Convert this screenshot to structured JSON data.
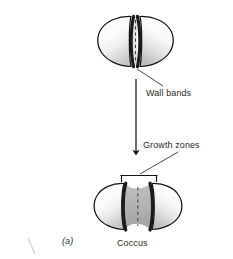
{
  "figure": {
    "panel_letter": "(a)",
    "caption": "Coccus",
    "labels": {
      "wall_bands": "Wall bands",
      "growth_zones": "Growth zones"
    },
    "colors": {
      "outline": "#1a1a1a",
      "band": "#202020",
      "cell_light": "#fbfbfb",
      "cell_shade": "#c9c9c9",
      "growth_zone_fill": "#b2b2b2",
      "septum_dash": "#4a4a4a",
      "text": "#2b2b2b",
      "background": "#ffffff"
    },
    "elements": {
      "top_cell_name": "coccus-before-division",
      "bottom_cell_name": "coccus-during-division",
      "arrow_name": "process-arrow-down",
      "bracket_name": "growth-zones-bracket",
      "wall_bands_leader": "wall-bands-leader-line",
      "growth_zones_leader": "growth-zones-leader-line",
      "scan_artifact": "scan-artifact-mark"
    }
  }
}
